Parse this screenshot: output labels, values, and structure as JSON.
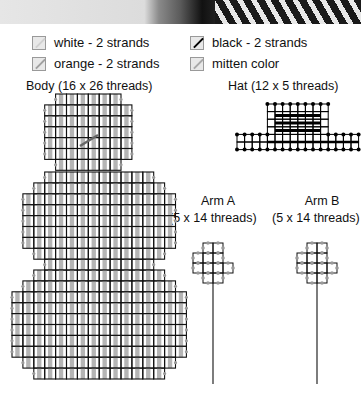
{
  "photo": {
    "description": "knitted mitten photo strip"
  },
  "legend": [
    {
      "label": "white - 2 strands",
      "color": "#d0d0d0",
      "x": 32,
      "y": 35
    },
    {
      "label": "black - 2 strands",
      "color": "#000000",
      "x": 190,
      "y": 35
    },
    {
      "label": "orange - 2 strands",
      "color": "#a0a0a0",
      "x": 32,
      "y": 56
    },
    {
      "label": "mitten color",
      "color": "#a8a8a8",
      "x": 190,
      "y": 56
    }
  ],
  "pieces": {
    "body": {
      "title": "Body (16 x 26 threads)"
    },
    "hat": {
      "title": "Hat (12 x 5 threads)"
    },
    "arm_a": {
      "name": "Arm A",
      "size": "(5 x 14 threads)"
    },
    "arm_b": {
      "name": "Arm B",
      "size": "(5 x 14 threads)"
    }
  },
  "colors": {
    "grid": "#111111",
    "fill": "#b5b5b5",
    "edge": "#9a9a9a",
    "black": "#000000"
  }
}
